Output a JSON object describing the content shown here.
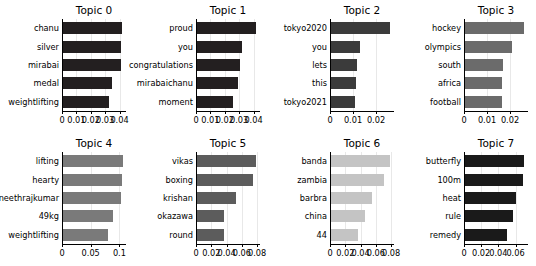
{
  "figure": {
    "background": "#ffffff",
    "rows": 2,
    "cols": 4
  },
  "chart_data": [
    {
      "type": "bar",
      "orientation": "horizontal",
      "title": "Topic 0",
      "categories": [
        "chanu",
        "silver",
        "mirabai",
        "medal",
        "weightlifting"
      ],
      "values": [
        0.0415,
        0.0412,
        0.041,
        0.035,
        0.033
      ],
      "xlabel": "",
      "ylabel": "",
      "xlim": [
        0,
        0.0445
      ],
      "xticks": [
        0,
        0.01,
        0.02,
        0.03,
        0.04
      ],
      "xticklabels": [
        "0",
        "0.01",
        "0.02",
        "0.03",
        "0.04"
      ],
      "color": "#231f20",
      "grid": true
    },
    {
      "type": "bar",
      "orientation": "horizontal",
      "title": "Topic 1",
      "categories": [
        "proud",
        "you",
        "congratulations",
        "mirabaichanu",
        "moment"
      ],
      "values": [
        0.0415,
        0.0322,
        0.0305,
        0.0295,
        0.0255
      ],
      "xlabel": "",
      "ylabel": "",
      "xlim": [
        0,
        0.0445
      ],
      "xticks": [
        0,
        0.01,
        0.02,
        0.03,
        0.04
      ],
      "xticklabels": [
        "0",
        "0.01",
        "0.02",
        "0.03",
        "0.04"
      ],
      "color": "#231f20",
      "grid": true
    },
    {
      "type": "bar",
      "orientation": "horizontal",
      "title": "Topic 2",
      "categories": [
        "tokyo2020",
        "you",
        "lets",
        "this",
        "tokyo2021"
      ],
      "values": [
        0.0262,
        0.0131,
        0.0116,
        0.0115,
        0.011
      ],
      "xlabel": "",
      "ylabel": "",
      "xlim": [
        0,
        0.0278
      ],
      "xticks": [
        0,
        0.01,
        0.02
      ],
      "xticklabels": [
        "0",
        "0.01",
        "0.02"
      ],
      "color": "#3b3b3b",
      "grid": true
    },
    {
      "type": "bar",
      "orientation": "horizontal",
      "title": "Topic 3",
      "categories": [
        "hockey",
        "olympics",
        "south",
        "africa",
        "football"
      ],
      "values": [
        0.0262,
        0.021,
        0.0171,
        0.0164,
        0.0164
      ],
      "xlabel": "",
      "ylabel": "",
      "xlim": [
        0,
        0.0278
      ],
      "xticks": [
        0,
        0.01,
        0.02
      ],
      "xticklabels": [
        "0",
        "0.01",
        "0.02"
      ],
      "color": "#6b6b6b",
      "grid": true
    },
    {
      "type": "bar",
      "orientation": "horizontal",
      "title": "Topic 4",
      "categories": [
        "lifting",
        "hearty",
        "puneethrajkumar",
        "49kg",
        "weightlifting"
      ],
      "values": [
        0.1055,
        0.1045,
        0.1035,
        0.0885,
        0.08
      ],
      "xlabel": "",
      "ylabel": "",
      "xlim": [
        0,
        0.1115
      ],
      "xticks": [
        0,
        0.05,
        0.1
      ],
      "xticklabels": [
        "0",
        "0.05",
        "0.1"
      ],
      "color": "#7a7a7a",
      "grid": true
    },
    {
      "type": "bar",
      "orientation": "horizontal",
      "title": "Topic 5",
      "categories": [
        "vikas",
        "boxing",
        "krishan",
        "okazawa",
        "round"
      ],
      "values": [
        0.079,
        0.0742,
        0.053,
        0.0372,
        0.037
      ],
      "xlabel": "",
      "ylabel": "",
      "xlim": [
        0,
        0.0838
      ],
      "xticks": [
        0,
        0.02,
        0.04,
        0.06,
        0.08
      ],
      "xticklabels": [
        "0",
        "0.02",
        "0.04",
        "0.06",
        "0.08"
      ],
      "color": "#5c5c5c",
      "grid": true
    },
    {
      "type": "bar",
      "orientation": "horizontal",
      "title": "Topic 6",
      "categories": [
        "banda",
        "zambia",
        "barbra",
        "china",
        "44"
      ],
      "values": [
        0.078,
        0.0712,
        0.055,
        0.0462,
        0.0372
      ],
      "xlabel": "",
      "ylabel": "",
      "xlim": [
        0,
        0.0838
      ],
      "xticks": [
        0,
        0.02,
        0.04,
        0.06,
        0.08
      ],
      "xticklabels": [
        "0",
        "0.02",
        "0.04",
        "0.06",
        "0.08"
      ],
      "color": "#c4c4c4",
      "grid": true
    },
    {
      "type": "bar",
      "orientation": "horizontal",
      "title": "Topic 7",
      "categories": [
        "butterfly",
        "100m",
        "heat",
        "rule",
        "remedy"
      ],
      "values": [
        0.0702,
        0.0684,
        0.0602,
        0.0572,
        0.05
      ],
      "xlabel": "",
      "ylabel": "",
      "xlim": [
        0,
        0.0745
      ],
      "xticks": [
        0,
        0.02,
        0.04,
        0.06
      ],
      "xticklabels": [
        "0",
        "0.02",
        "0.04",
        "0.06"
      ],
      "color": "#1a1a1a",
      "grid": true
    }
  ]
}
